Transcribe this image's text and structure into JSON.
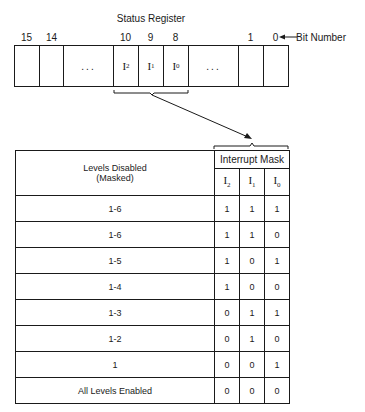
{
  "diagram": {
    "register": {
      "title": "Status Register",
      "bit_number_label": "Bit Number",
      "bit_numbers": [
        "15",
        "14",
        "10",
        "9",
        "8",
        "1",
        "0"
      ],
      "cells": [
        {
          "bit": "15",
          "label": ""
        },
        {
          "bit": "14",
          "label": ""
        },
        {
          "bit": "",
          "label": "..."
        },
        {
          "bit": "10",
          "label": "I",
          "sub": "2"
        },
        {
          "bit": "9",
          "label": "I",
          "sub": "1"
        },
        {
          "bit": "8",
          "label": "I",
          "sub": "0"
        },
        {
          "bit": "",
          "label": "..."
        },
        {
          "bit": "1",
          "label": ""
        },
        {
          "bit": "0",
          "label": ""
        }
      ]
    },
    "table": {
      "col_header_left": "Levels Disabled",
      "col_header_left_line2": "(Masked)",
      "col_header_right": "Interrupt Mask",
      "mask_columns": [
        {
          "label": "I",
          "sub": "2"
        },
        {
          "label": "I",
          "sub": "1"
        },
        {
          "label": "I",
          "sub": "0"
        }
      ],
      "rows": [
        {
          "levels": "1-6",
          "i2": "1",
          "i1": "1",
          "i0": "1"
        },
        {
          "levels": "1-6",
          "i2": "1",
          "i1": "1",
          "i0": "0"
        },
        {
          "levels": "1-5",
          "i2": "1",
          "i1": "0",
          "i0": "1"
        },
        {
          "levels": "1-4",
          "i2": "1",
          "i1": "0",
          "i0": "0"
        },
        {
          "levels": "1-3",
          "i2": "0",
          "i1": "1",
          "i0": "1"
        },
        {
          "levels": "1-2",
          "i2": "0",
          "i1": "1",
          "i0": "0"
        },
        {
          "levels": "1",
          "i2": "0",
          "i1": "0",
          "i0": "1"
        },
        {
          "levels": "All Levels Enabled",
          "i2": "0",
          "i1": "0",
          "i0": "0"
        }
      ]
    }
  }
}
